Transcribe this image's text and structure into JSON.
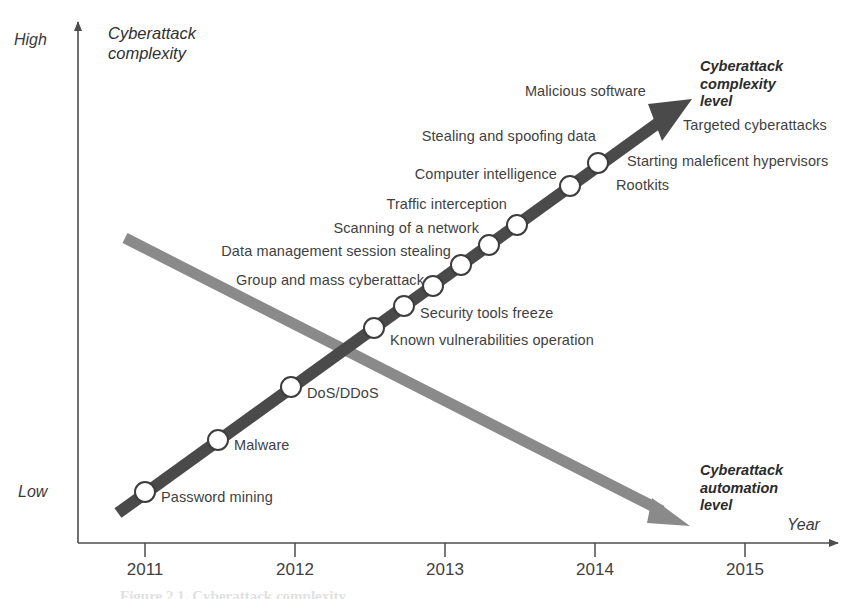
{
  "figure": {
    "caption": "Figure 2.1. Cyberattack complexity",
    "y_axis": {
      "title_line1": "Cyberattack",
      "title_line2": "complexity",
      "high_label": "High",
      "low_label": "Low"
    },
    "x_axis": {
      "title": "Year",
      "ticks": [
        "2011",
        "2012",
        "2013",
        "2014",
        "2015"
      ]
    },
    "arrow_titles": {
      "complexity": [
        "Cyberattack",
        "complexity",
        "level"
      ],
      "automation": [
        "Cyberattack",
        "automation",
        "level"
      ]
    }
  },
  "chart_data": {
    "type": "scatter",
    "title": "Cyberattack complexity",
    "xlabel": "Year",
    "ylabel": "Cyberattack complexity",
    "xlim": [
      2010.7,
      2015.7
    ],
    "ylim": [
      "Low",
      "High"
    ],
    "grid": false,
    "legend": "none",
    "annotations": [
      "Cyberattack complexity level",
      "Cyberattack automation level"
    ],
    "series": [
      {
        "name": "Cyberattack complexity level",
        "kind": "arrow-with-markers",
        "color": "#4a4a4a",
        "direction": "ascending",
        "start": {
          "x": 118,
          "y": 513
        },
        "end": {
          "x": 690,
          "y": 100
        },
        "points": [
          {
            "label": "Password mining",
            "x": 145,
            "y": 492,
            "label_side": "right",
            "label_x": 161,
            "label_y": 498
          },
          {
            "label": "Malware",
            "x": 218,
            "y": 440,
            "label_side": "right",
            "label_x": 234,
            "label_y": 446
          },
          {
            "label": "DoS/DDoS",
            "x": 291,
            "y": 387,
            "label_side": "right",
            "label_x": 307,
            "label_y": 394
          },
          {
            "label": "Known vulnerabilities operation",
            "x": 374,
            "y": 328,
            "label_side": "right",
            "label_x": 390,
            "label_y": 341
          },
          {
            "label": "Security tools freeze",
            "x": 404,
            "y": 306,
            "label_side": "right",
            "label_x": 420,
            "label_y": 314
          },
          {
            "label": "Group and mass cyberattack",
            "x": 433,
            "y": 286,
            "label_side": "left",
            "label_x": 424,
            "label_y": 281
          },
          {
            "label": "Data management session stealing",
            "x": 461,
            "y": 265,
            "label_side": "left",
            "label_x": 451,
            "label_y": 252
          },
          {
            "label": "Scanning of a network",
            "x": 489,
            "y": 245,
            "label_side": "left",
            "label_x": 479,
            "label_y": 229
          },
          {
            "label": "Traffic interception",
            "x": 517,
            "y": 225,
            "label_side": "left",
            "label_x": 507,
            "label_y": 205
          },
          {
            "label": "Computer intelligence",
            "x": 570,
            "y": 186,
            "label_side": "left",
            "label_x": 557,
            "label_y": 175
          },
          {
            "label": "Rootkits",
            "x": 598,
            "y": 163,
            "label_side": "right",
            "label_x": 616,
            "label_y": 186
          }
        ],
        "extra_labels": [
          {
            "text": "Stealing and spoofing data",
            "x": 596,
            "y": 137,
            "align": "right"
          },
          {
            "text": "Malicious software",
            "x": 646,
            "y": 92,
            "align": "right"
          },
          {
            "text": "Targeted cyberattacks",
            "x": 683,
            "y": 126,
            "align": "left"
          },
          {
            "text": "Starting maleficent hypervisors",
            "x": 627,
            "y": 162,
            "align": "left"
          }
        ]
      },
      {
        "name": "Cyberattack automation level",
        "kind": "arrow",
        "color": "#8a8a8a",
        "direction": "descending",
        "start": {
          "x": 125,
          "y": 238
        },
        "end": {
          "x": 688,
          "y": 525
        },
        "points": []
      }
    ]
  },
  "colors": {
    "complexity_arrow": "#4a4a4a",
    "automation_arrow": "#8a8a8a",
    "axis": "#4d4d4d",
    "text": "#3f3f3f",
    "marker_fill": "#ffffff"
  }
}
